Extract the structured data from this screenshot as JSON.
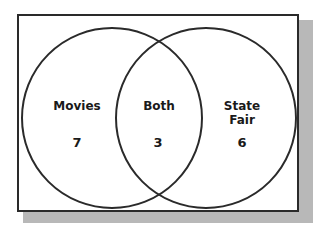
{
  "diagram": {
    "type": "venn",
    "sets": [
      {
        "label": "Movies",
        "only_count": "7"
      },
      {
        "label": "State Fair",
        "only_count": "6"
      }
    ],
    "intersection": {
      "label": "Both",
      "count": "3"
    }
  }
}
